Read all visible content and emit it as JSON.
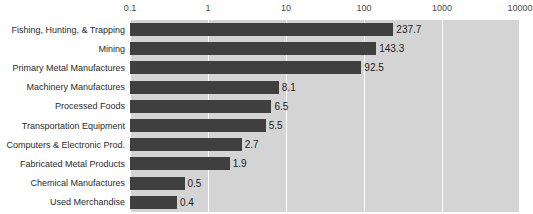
{
  "chart_data": {
    "type": "bar",
    "orientation": "horizontal",
    "title": "",
    "subtitle": "",
    "xlabel": "",
    "ylabel": "",
    "xscale": "log",
    "xlim": [
      0.1,
      10000
    ],
    "xticks": [
      0.1,
      1,
      10,
      100,
      1000,
      10000
    ],
    "xtick_labels": [
      "0.1",
      "1",
      "10",
      "100",
      "1000",
      "10000"
    ],
    "grid": true,
    "legend": false,
    "axis_position": "top",
    "categories": [
      "Fishing, Hunting, & Trapping",
      "Mining",
      "Primary Metal Manufactures",
      "Machinery Manufactures",
      "Processed Foods",
      "Transportation Equipment",
      "Computers & Electronic Prod.",
      "Fabricated Metal Products",
      "Chemical Manufactures",
      "Used Merchandise"
    ],
    "values": [
      237.7,
      143.3,
      92.5,
      8.1,
      6.5,
      5.5,
      2.7,
      1.9,
      0.5,
      0.4
    ],
    "value_labels": [
      "237.7",
      "143.3",
      "92.5",
      "8.1",
      "6.5",
      "5.5",
      "2.7",
      "1.9",
      "0.5",
      "0.4"
    ]
  },
  "style": {
    "bar_color": "#3f3f3f",
    "plot_background": "#d4d4d4",
    "gridline_color": "#ffffff",
    "page_background": "#ffffff",
    "tick_text_color": "#4a4a4a",
    "category_text_color": "#2b2b2b",
    "value_text_color": "#1c1c1c"
  }
}
